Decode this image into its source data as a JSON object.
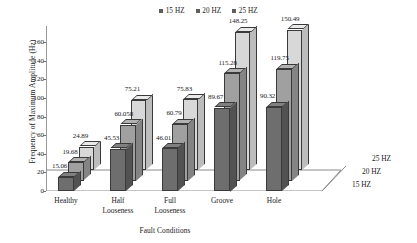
{
  "chart_data": {
    "type": "bar",
    "title": "",
    "xlabel": "Fault Conditions",
    "ylabel": "Frequency of  Maximum Amplitude (Hz)",
    "zlabel": "",
    "categories": [
      "Healthy",
      "Half\nLooseness",
      "Full\nLooseness",
      "Groove",
      "Hole"
    ],
    "series": [
      {
        "name": "15 HZ",
        "color": "#6e6e6e",
        "values": [
          15.06,
          45.53,
          46.01,
          89.67,
          90.32
        ]
      },
      {
        "name": "20 HZ",
        "color": "#a0a0a0",
        "values": [
          19.68,
          60.058,
          60.79,
          115.28,
          119.75
        ]
      },
      {
        "name": "25 HZ",
        "color": "#d8d8d8",
        "values": [
          24.89,
          75.21,
          75.83,
          148.25,
          150.49
        ]
      }
    ],
    "value_labels": [
      [
        "15.06",
        "45.53",
        "46.01",
        "89.67",
        "90.32"
      ],
      [
        "19.68",
        "60.058",
        "60.79",
        "115.28",
        "119.75"
      ],
      [
        "24.89",
        "75.21",
        "75.83",
        "148.25",
        "150.49"
      ]
    ],
    "ylim": [
      0,
      160
    ],
    "yticks": [
      "0",
      "20",
      "40",
      "60",
      "80",
      "100",
      "120",
      "140",
      "160"
    ],
    "ytick_values": [
      0,
      20,
      40,
      60,
      80,
      100,
      120,
      140,
      160
    ],
    "grid": false,
    "legend_position": "top-center",
    "depth_axis_labels": [
      "15 HZ",
      "20 HZ",
      "25 HZ"
    ],
    "projection": "3d"
  },
  "legend": {
    "entries": [
      {
        "label": "15 HZ",
        "color": "#5e5e5e"
      },
      {
        "label": "20 HZ",
        "color": "#5e5e5e"
      },
      {
        "label": "25 HZ",
        "color": "#5e5e5e"
      }
    ]
  },
  "axes": {
    "y_title": "Frequency of  Maximum Amplitude (Hz)",
    "x_title": "Fault Conditions"
  }
}
